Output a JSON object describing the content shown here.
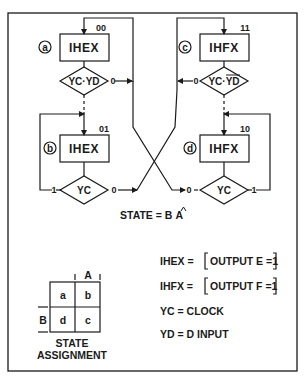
{
  "diagram": {
    "states": [
      {
        "id": "a",
        "circle_label": "a",
        "code": "00",
        "box_label": "IHEX",
        "decision": "YC·YD",
        "decision_overbar": "",
        "exit_label": "0"
      },
      {
        "id": "b",
        "circle_label": "b",
        "code": "01",
        "box_label": "IHEX",
        "decision": "YC",
        "decision_overbar": "",
        "left_exit_label": "1",
        "right_exit_label": "0"
      },
      {
        "id": "c",
        "circle_label": "c",
        "code": "11",
        "box_label": "IHFX",
        "decision_prefix": "YC·",
        "decision_overbar": "YD",
        "exit_label": "0"
      },
      {
        "id": "d",
        "circle_label": "d",
        "code": "10",
        "box_label": "IHFX",
        "decision": "YC",
        "left_exit_label": "0",
        "right_exit_label": "1"
      }
    ],
    "state_equation": {
      "prefix": "STATE = B",
      "suffix": "A"
    },
    "definitions": [
      {
        "lhs": "IHEX =",
        "rhs": "OUTPUT E =1"
      },
      {
        "lhs": "IHFX =",
        "rhs": "OUTPUT F =1"
      },
      {
        "lhs": "YC = CLOCK",
        "rhs": ""
      },
      {
        "lhs": "YD = D INPUT",
        "rhs": ""
      }
    ],
    "state_assignment": {
      "col_header": "A",
      "row_header": "B",
      "cells": [
        [
          "a",
          "b"
        ],
        [
          "d",
          "c"
        ]
      ],
      "caption_line1": "STATE",
      "caption_line2": "ASSIGNMENT"
    }
  }
}
